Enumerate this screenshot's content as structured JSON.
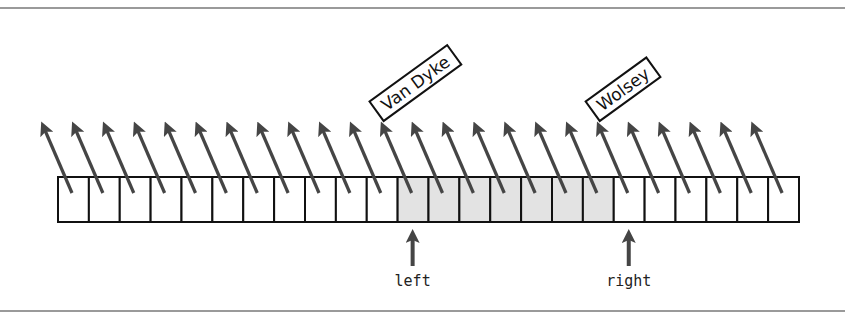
{
  "diagram": {
    "cell_count": 24,
    "cells_left": 58,
    "cells_top": 177,
    "cell_width": 30.875,
    "cell_height": 45,
    "shaded_range": [
      11,
      17
    ],
    "shaded_color": "#e3e3e3",
    "arrow_color": "#454545",
    "labels": [
      {
        "text": "Van Dyke",
        "cell": 11
      },
      {
        "text": "Wolsey",
        "cell": 18
      }
    ],
    "pointers": [
      {
        "text": "left",
        "cell": 11
      },
      {
        "text": "right",
        "cell": 18
      }
    ]
  }
}
